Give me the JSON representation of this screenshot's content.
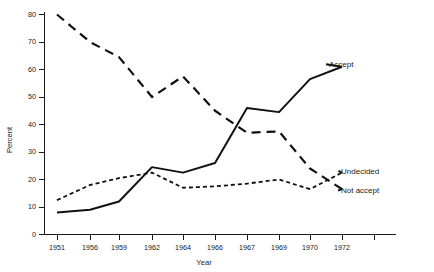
{
  "chart_data": {
    "type": "line",
    "title": "",
    "xlabel": "Year",
    "ylabel": "Percent",
    "ylim": [
      0,
      80
    ],
    "ytick_labels": [
      "0",
      "10",
      "20",
      "30",
      "40",
      "50",
      "60",
      "70",
      "80"
    ],
    "ytick_values": [
      0,
      10,
      20,
      30,
      40,
      50,
      60,
      70,
      80
    ],
    "grid": false,
    "legend_position": "right-inline",
    "categories": [
      "1951",
      "1956",
      "1959",
      "1962",
      "1964",
      "1966",
      "1967",
      "1969",
      "1970",
      "1972"
    ],
    "xtick_labels": [
      "1951",
      "1956",
      "1959",
      "1962",
      "1964",
      "1966",
      "1967",
      "1969",
      "1970",
      "1972",
      ""
    ],
    "series": [
      {
        "name": "Accept",
        "style": "solid",
        "label": "Accept",
        "values": [
          8,
          9,
          12,
          24.5,
          22.5,
          26,
          46,
          44.5,
          56.5,
          61
        ]
      },
      {
        "name": "Not accept",
        "style": "long-dash",
        "label": "Not accept",
        "values": [
          80,
          70,
          64.5,
          50,
          57.5,
          45,
          37,
          37.5,
          24,
          16.5
        ]
      },
      {
        "name": "Undecided",
        "style": "short-dash",
        "label": "Undecided",
        "values": [
          12.5,
          18,
          20.5,
          22.5,
          17,
          17.5,
          18.5,
          20,
          16.5,
          22.5
        ]
      }
    ],
    "colors": {
      "line": "#111111",
      "axis": "#1a1a1a",
      "background": "#ffffff"
    }
  }
}
